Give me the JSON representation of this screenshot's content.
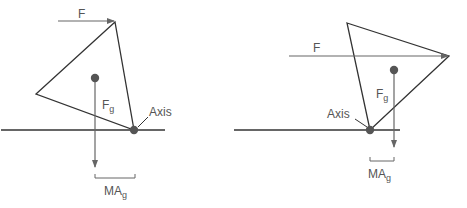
{
  "diagrams": [
    {
      "force_label": "F",
      "gravity_label": "F",
      "gravity_sub": "g",
      "axis_label": "Axis",
      "moment_arm_label": "MA",
      "moment_arm_sub": "g"
    },
    {
      "force_label": "F",
      "gravity_label": "F",
      "gravity_sub": "g",
      "axis_label": "Axis",
      "moment_arm_label": "MA",
      "moment_arm_sub": "g"
    }
  ],
  "colors": {
    "line": "#333333",
    "arrow": "#666666",
    "dot": "#555555",
    "text": "#555555"
  }
}
